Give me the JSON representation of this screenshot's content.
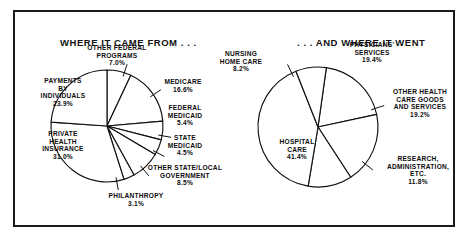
{
  "figure": {
    "left_panel_title": "WHERE IT CAME FROM . . .",
    "right_panel_title": ". . . AND WHERE IT WENT",
    "border_color": "#1a1a1a",
    "slice_fill": "#ffffff",
    "slice_stroke": "#111111"
  },
  "chart_data": [
    {
      "type": "pie",
      "title": "WHERE IT CAME FROM . . .",
      "xlabel": "",
      "ylabel": "",
      "legend": "none",
      "grid": false,
      "categories": [
        "OTHER FEDERAL PROGRAMS",
        "MEDICARE",
        "FEDERAL MEDICAID",
        "STATE MEDICAID",
        "OTHER STATE/LOCAL GOVERNMENT",
        "PHILANTHROPY",
        "PRIVATE HEALTH INSURANCE",
        "PAYMENTS BY INDIVIDUALS"
      ],
      "values": [
        7.0,
        16.6,
        5.4,
        4.5,
        8.5,
        3.1,
        31.0,
        23.9
      ],
      "labels": [
        {
          "name": "OTHER FEDERAL PROGRAMS",
          "line1": "OTHER FEDERAL",
          "line2": "PROGRAMS",
          "pct": "7.0%"
        },
        {
          "name": "MEDICARE",
          "line1": "MEDICARE",
          "line2": "",
          "pct": "16.6%"
        },
        {
          "name": "FEDERAL MEDICAID",
          "line1": "FEDERAL",
          "line2": "MEDICAID",
          "pct": "5.4%"
        },
        {
          "name": "STATE MEDICAID",
          "line1": "STATE",
          "line2": "MEDICAID",
          "pct": "4.5%"
        },
        {
          "name": "OTHER STATE/LOCAL GOVERNMENT",
          "line1": "OTHER STATE/LOCAL",
          "line2": "GOVERNMENT",
          "pct": "8.5%"
        },
        {
          "name": "PHILANTHROPY",
          "line1": "PHILANTHROPY",
          "line2": "",
          "pct": "3.1%"
        },
        {
          "name": "PRIVATE HEALTH INSURANCE",
          "line1": "PRIVATE",
          "line2": "HEALTH",
          "line3": "INSURANCE",
          "pct": "31.0%"
        },
        {
          "name": "PAYMENTS BY INDIVIDUALS",
          "line1": "PAYMENTS",
          "line2": "BY",
          "line3": "INDIVIDUALS",
          "pct": "23.9%"
        }
      ]
    },
    {
      "type": "pie",
      "title": ". . . AND WHERE IT WENT",
      "xlabel": "",
      "ylabel": "",
      "legend": "none",
      "grid": false,
      "categories": [
        "PHYSICIANS' SERVICES",
        "OTHER HEALTH CARE GOODS AND SERVICES",
        "RESEARCH, ADMINISTRATION, ETC.",
        "HOSPITAL CARE",
        "NURSING HOME CARE"
      ],
      "values": [
        19.4,
        19.2,
        11.8,
        41.4,
        8.2
      ],
      "labels": [
        {
          "name": "PHYSICIANS' SERVICES",
          "line1": "PHYSICIANS'",
          "line2": "SERVICES",
          "pct": "19.4%"
        },
        {
          "name": "OTHER HEALTH CARE GOODS AND SERVICES",
          "line1": "OTHER HEALTH",
          "line2": "CARE GOODS",
          "line3": "AND SERVICES",
          "pct": "19.2%"
        },
        {
          "name": "RESEARCH, ADMINISTRATION, ETC.",
          "line1": "RESEARCH,",
          "line2": "ADMINISTRATION,",
          "line3": "ETC.",
          "pct": "11.8%"
        },
        {
          "name": "HOSPITAL CARE",
          "line1": "HOSPITAL",
          "line2": "CARE",
          "pct": "41.4%"
        },
        {
          "name": "NURSING HOME CARE",
          "line1": "NURSING",
          "line2": "HOME CARE",
          "pct": "8.2%"
        }
      ]
    }
  ],
  "left_labels": {
    "other_federal_l1": "OTHER FEDERAL",
    "other_federal_l2": "PROGRAMS",
    "other_federal_pct": "7.0%",
    "medicare_l1": "MEDICARE",
    "medicare_pct": "16.6%",
    "fed_medicaid_l1": "FEDERAL",
    "fed_medicaid_l2": "MEDICAID",
    "fed_medicaid_pct": "5.4%",
    "state_medicaid_l1": "STATE",
    "state_medicaid_l2": "MEDICAID",
    "state_medicaid_pct": "4.5%",
    "other_state_l1": "OTHER STATE/LOCAL",
    "other_state_l2": "GOVERNMENT",
    "other_state_pct": "8.5%",
    "philanthropy_l1": "PHILANTHROPY",
    "philanthropy_pct": "3.1%",
    "private_l1": "PRIVATE",
    "private_l2": "HEALTH",
    "private_l3": "INSURANCE",
    "private_pct": "31.0%",
    "payments_l1": "PAYMENTS",
    "payments_l2": "BY",
    "payments_l3": "INDIVIDUALS",
    "payments_pct": "23.9%"
  },
  "right_labels": {
    "nursing_l1": "NURSING",
    "nursing_l2": "HOME CARE",
    "nursing_pct": "8.2%",
    "physicians_l1": "PHYSICIANS'",
    "physicians_l2": "SERVICES",
    "physicians_pct": "19.4%",
    "other_goods_l1": "OTHER HEALTH",
    "other_goods_l2": "CARE GOODS",
    "other_goods_l3": "AND SERVICES",
    "other_goods_pct": "19.2%",
    "research_l1": "RESEARCH,",
    "research_l2": "ADMINISTRATION,",
    "research_l3": "ETC.",
    "research_pct": "11.8%",
    "hospital_l1": "HOSPITAL",
    "hospital_l2": "CARE",
    "hospital_pct": "41.4%"
  }
}
